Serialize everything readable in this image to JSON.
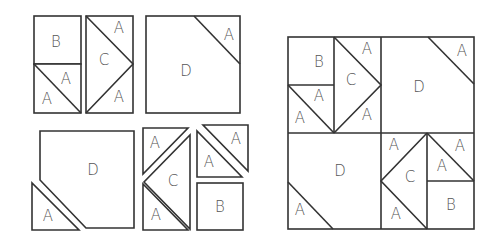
{
  "diagram": {
    "title": "",
    "colors": {
      "stroke": "#333333",
      "label": "#555555",
      "fill": "#ffffff"
    },
    "labels": {
      "A": "A",
      "B": "B",
      "C": "C",
      "D": "D"
    },
    "exploded_pieces": {
      "top_left_unit": [
        "B",
        "A",
        "A"
      ],
      "top_flying_geese": [
        "A",
        "C",
        "A"
      ],
      "top_corner_square": [
        "D",
        "A"
      ],
      "bottom_corner_square": [
        "D",
        "A"
      ],
      "bottom_flying_geese": [
        "A",
        "C",
        "A"
      ],
      "bottom_right_unit": [
        "A",
        "A",
        "B"
      ]
    },
    "assembled_block": {
      "quadrants": [
        {
          "position": "top-left",
          "pieces": [
            "B",
            "A",
            "A",
            "A",
            "C",
            "A"
          ]
        },
        {
          "position": "top-right",
          "pieces": [
            "D",
            "A"
          ]
        },
        {
          "position": "bottom-left",
          "pieces": [
            "D",
            "A"
          ]
        },
        {
          "position": "bottom-right",
          "pieces": [
            "A",
            "C",
            "A",
            "A",
            "A",
            "B"
          ]
        }
      ]
    }
  }
}
